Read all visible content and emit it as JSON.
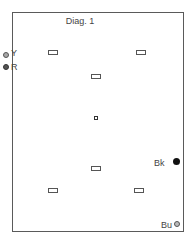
{
  "diagram": {
    "title": "Diag. 1",
    "markers": [
      {
        "label": "Y",
        "color": "#a0a0a0",
        "border": "#555555"
      },
      {
        "label": "R",
        "color": "#555555",
        "border": "#333333"
      },
      {
        "label": "Bk",
        "color": "#111111",
        "border": "#111111"
      },
      {
        "label": "Bu",
        "color": "#ffffff",
        "border": "#555555"
      }
    ],
    "rectangles": [
      {
        "id": "rect-top-left",
        "x": 48,
        "y": 50
      },
      {
        "id": "rect-top-right",
        "x": 136,
        "y": 50
      },
      {
        "id": "rect-upper-center",
        "x": 91,
        "y": 74
      },
      {
        "id": "rect-lower-center",
        "x": 91,
        "y": 166
      },
      {
        "id": "rect-bottom-left",
        "x": 48,
        "y": 188
      },
      {
        "id": "rect-bottom-right",
        "x": 134,
        "y": 188
      }
    ],
    "center_point": {
      "x": 95,
      "y": 117
    }
  }
}
